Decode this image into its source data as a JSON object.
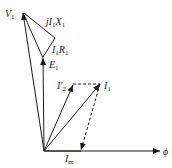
{
  "diagram": {
    "colors": {
      "line": "#1a1a1a",
      "background": "#ffffff"
    },
    "labels": {
      "V1": {
        "main": "V",
        "sub": "1"
      },
      "jI1X1": {
        "pre": "jI",
        "sub1": "1",
        "mid": "X",
        "sub2": "1"
      },
      "I1R1": {
        "pre": "I",
        "sub1": "1",
        "mid": "R",
        "sub2": "1"
      },
      "E1": {
        "main": "E",
        "sub": "1"
      },
      "I2p": {
        "main": "I'",
        "sub": "2"
      },
      "I1": {
        "main": "I",
        "sub": "1"
      },
      "Im": {
        "main": "I",
        "sub": "m"
      },
      "phi": {
        "main": "ϕ"
      }
    },
    "phasors": [
      {
        "name": "V1",
        "from": [
          44,
          151
        ],
        "to": [
          23,
          12
        ],
        "style": "solid"
      },
      {
        "name": "E1",
        "from": [
          44,
          151
        ],
        "to": [
          43,
          57
        ],
        "style": "solid"
      },
      {
        "name": "I1R1",
        "from": [
          43,
          57
        ],
        "to": [
          55,
          38
        ],
        "style": "solid"
      },
      {
        "name": "jI1X1",
        "from": [
          55,
          38
        ],
        "to": [
          23,
          12
        ],
        "style": "solid"
      },
      {
        "name": "V1-to-E1-edge",
        "from": [
          23,
          12
        ],
        "to": [
          43,
          57
        ],
        "style": "solid"
      },
      {
        "name": "I2p",
        "from": [
          44,
          151
        ],
        "to": [
          73,
          84
        ],
        "style": "solid"
      },
      {
        "name": "I1",
        "from": [
          44,
          151
        ],
        "to": [
          100,
          84
        ],
        "style": "solid"
      },
      {
        "name": "I2p-to-I1",
        "from": [
          73,
          84
        ],
        "to": [
          100,
          84
        ],
        "style": "dashed"
      },
      {
        "name": "I1-to-Im",
        "from": [
          100,
          84
        ],
        "to": [
          81,
          151
        ],
        "style": "dashed"
      },
      {
        "name": "Im",
        "from": [
          44,
          151
        ],
        "to": [
          81,
          151
        ],
        "style": "solid"
      },
      {
        "name": "phi",
        "from": [
          44,
          151
        ],
        "to": [
          159,
          151
        ],
        "style": "solid"
      }
    ]
  }
}
